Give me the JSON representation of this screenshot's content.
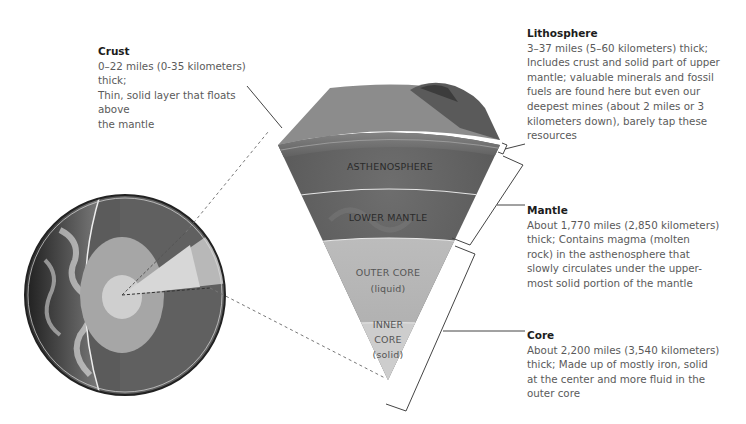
{
  "labels": {
    "crust": {
      "title": "Crust",
      "lines": [
        "0–22 miles (0-35 kilometers) thick;",
        "Thin, solid layer that floats above",
        "the mantle"
      ]
    },
    "lithosphere": {
      "title": "Lithosphere",
      "lines": [
        "3–37 miles (5–60 kilometers) thick;",
        "Includes crust and solid part of upper",
        "mantle; valuable minerals and fossil",
        "fuels are found here but even our",
        "deepest mines (about 2 miles or 3",
        "kilometers down), barely tap these",
        "resources"
      ]
    },
    "mantle": {
      "title": "Mantle",
      "lines": [
        "About 1,770 miles (2,850 kilometers)",
        "thick; Contains magma (molten",
        "rock) in the asthenosphere that",
        "slowly circulates under the upper-",
        "most solid portion of the mantle"
      ]
    },
    "core": {
      "title": "Core",
      "lines": [
        "About 2,200 miles (3,540 kilometers)",
        "thick; Made up of mostly iron, solid",
        "at the center and more fluid in the",
        "outer core"
      ]
    }
  },
  "wedge_layers": {
    "asthenosphere": "ASTHENOSPHERE",
    "lower_mantle": "LOWER MANTLE",
    "outer_core": [
      "OUTER CORE",
      "(liquid)"
    ],
    "inner_core": [
      "INNER",
      "CORE",
      "(solid)"
    ]
  },
  "colors": {
    "crust": "#6b6b6b",
    "mantle": "#5e5e5e",
    "outer_core": "#b4b4b4",
    "inner_core": "#d2d2d2",
    "text_title": "#1c1c1c",
    "text_body": "#5a5a5a",
    "leader_line": "#444444"
  }
}
